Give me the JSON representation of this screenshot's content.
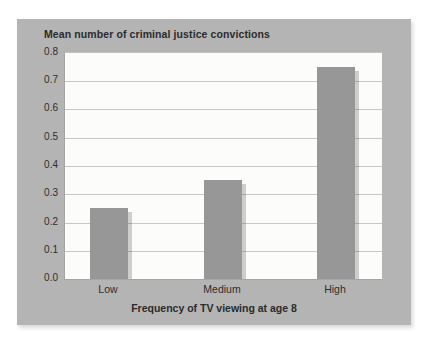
{
  "figure": {
    "background": "#ffffff",
    "panel_background": "#b4b4b4",
    "text_color": "#2b2b2b"
  },
  "chart_data": {
    "type": "bar",
    "title": "Mean number of criminal justice convictions",
    "xlabel": "Frequency of TV viewing at age 8",
    "ylabel": "",
    "categories": [
      "Low",
      "Medium",
      "High"
    ],
    "values": [
      0.25,
      0.35,
      0.75
    ],
    "ylim": [
      0,
      0.8
    ],
    "ytick_step": 0.1,
    "ytick_labels": [
      "0.0",
      "0.1",
      "0.2",
      "0.3",
      "0.4",
      "0.5",
      "0.6",
      "0.7",
      "0.8"
    ],
    "grid": true,
    "legend": false,
    "bar_color": "#979797",
    "plot_background": "#fcfcfb",
    "gridline_color": "#c8c8c8"
  }
}
